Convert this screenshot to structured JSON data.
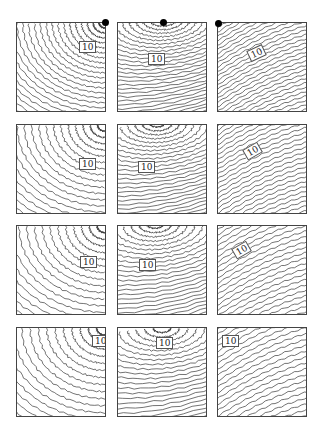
{
  "figure": {
    "contour_label": "10",
    "line_color": "#333333",
    "panel_size": 90,
    "columns_x": [
      16,
      117,
      217
    ],
    "rows_y": [
      22,
      124,
      225,
      327
    ]
  },
  "source_markers": [
    {
      "x": 105,
      "y": 22
    },
    {
      "x": 163,
      "y": 22
    },
    {
      "x": 218,
      "y": 23
    }
  ],
  "panels": [
    {
      "row": 0,
      "col": 0,
      "label": "10",
      "label_pos": [
        62,
        18
      ],
      "rotate": 0,
      "center": [
        90,
        0
      ],
      "type": "radial",
      "spacing": 6
    },
    {
      "row": 0,
      "col": 1,
      "label": "10",
      "label_pos": [
        30,
        30
      ],
      "rotate": 0,
      "center": [
        46,
        -4
      ],
      "type": "tilt",
      "spacing": 5.5
    },
    {
      "row": 0,
      "col": 2,
      "label": "10",
      "label_pos": [
        30,
        24
      ],
      "rotate": -25,
      "center": [
        0,
        0
      ],
      "type": "diag",
      "spacing": 4.5
    },
    {
      "row": 1,
      "col": 0,
      "label": "10",
      "label_pos": [
        62,
        33
      ],
      "rotate": 0,
      "center": [
        90,
        0
      ],
      "type": "radial",
      "spacing": 7.5
    },
    {
      "row": 1,
      "col": 1,
      "label": "10",
      "label_pos": [
        20,
        36
      ],
      "rotate": 0,
      "center": [
        40,
        -2
      ],
      "type": "tilt",
      "spacing": 6
    },
    {
      "row": 1,
      "col": 2,
      "label": "10",
      "label_pos": [
        26,
        20
      ],
      "rotate": -30,
      "center": [
        0,
        0
      ],
      "type": "diag",
      "spacing": 5
    },
    {
      "row": 2,
      "col": 0,
      "label": "10",
      "label_pos": [
        63,
        30
      ],
      "rotate": 0,
      "center": [
        90,
        0
      ],
      "type": "radial",
      "spacing": 8
    },
    {
      "row": 2,
      "col": 1,
      "label": "10",
      "label_pos": [
        21,
        33
      ],
      "rotate": 0,
      "center": [
        38,
        -2
      ],
      "type": "tilt",
      "spacing": 6.5
    },
    {
      "row": 2,
      "col": 2,
      "label": "10",
      "label_pos": [
        15,
        18
      ],
      "rotate": -30,
      "center": [
        0,
        0
      ],
      "type": "diag",
      "spacing": 5.5
    },
    {
      "row": 3,
      "col": 0,
      "label": "10",
      "label_pos": [
        75,
        7
      ],
      "rotate": 0,
      "center": [
        90,
        0
      ],
      "type": "radial",
      "spacing": 8.5
    },
    {
      "row": 3,
      "col": 1,
      "label": "10",
      "label_pos": [
        38,
        9
      ],
      "rotate": 0,
      "center": [
        45,
        0
      ],
      "type": "tilt",
      "spacing": 7
    },
    {
      "row": 3,
      "col": 2,
      "label": "10",
      "label_pos": [
        4,
        7
      ],
      "rotate": 0,
      "center": [
        0,
        0
      ],
      "type": "diag",
      "spacing": 6
    }
  ]
}
